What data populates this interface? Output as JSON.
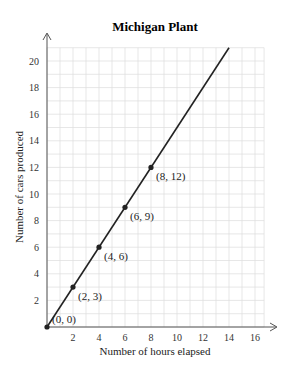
{
  "chart_data": {
    "type": "line",
    "title": "Michigan Plant",
    "xlabel": "Number of hours elapsed",
    "ylabel": "Number of cars produced",
    "xlim": [
      0,
      17
    ],
    "ylim": [
      0,
      21
    ],
    "xticks": [
      2,
      4,
      6,
      8,
      10,
      12,
      14,
      16
    ],
    "yticks": [
      2,
      4,
      6,
      8,
      10,
      12,
      14,
      16,
      18,
      20
    ],
    "grid": true,
    "legend": null,
    "series": [
      {
        "name": "Michigan Plant",
        "x": [
          0,
          14
        ],
        "y": [
          0,
          21
        ],
        "equation": "y = 1.5x"
      }
    ],
    "points": [
      {
        "x": 0,
        "y": 0,
        "label": "(0, 0)"
      },
      {
        "x": 2,
        "y": 3,
        "label": "(2, 3)"
      },
      {
        "x": 4,
        "y": 6,
        "label": "(4, 6)"
      },
      {
        "x": 6,
        "y": 9,
        "label": "(6, 9)"
      },
      {
        "x": 8,
        "y": 12,
        "label": "(8, 12)"
      }
    ]
  },
  "colors": {
    "line": "#222222",
    "grid": "#dddddd",
    "axis": "#555555"
  }
}
